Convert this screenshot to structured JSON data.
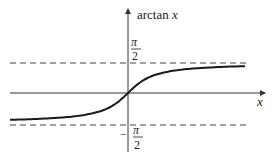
{
  "chart_data": {
    "type": "line",
    "title": "",
    "xlabel": "x",
    "ylabel": "arctan x",
    "function": "arctan(x)",
    "x": [
      -6,
      -4,
      -3,
      -2,
      -1,
      -0.5,
      0,
      0.5,
      1,
      2,
      3,
      4,
      6
    ],
    "series": [
      {
        "name": "arctan x",
        "values": [
          -1.4056,
          -1.3258,
          -1.249,
          -1.1071,
          -0.7854,
          -0.4636,
          0,
          0.4636,
          0.7854,
          1.1071,
          1.249,
          1.3258,
          1.4056
        ]
      }
    ],
    "asymptotes": [
      {
        "y": 1.5708,
        "label_numerator": "π",
        "label_denominator": "2",
        "label_sign": "",
        "style": "dashed"
      },
      {
        "y": -1.5708,
        "label_numerator": "π",
        "label_denominator": "2",
        "label_sign": "−",
        "style": "dashed"
      }
    ],
    "ylim": [
      -1.8,
      2.6
    ],
    "xlim": [
      -6,
      6
    ],
    "grid": false,
    "legend": "none"
  },
  "labels": {
    "y_axis": "arctan ",
    "y_axis_var": "x",
    "x_axis": "x",
    "upper_num": "π",
    "upper_den": "2",
    "lower_sign": "−",
    "lower_num": "π",
    "lower_den": "2"
  },
  "colors": {
    "curve": "#1a1a1a",
    "axes": "#333333",
    "asymptote": "#444444"
  }
}
